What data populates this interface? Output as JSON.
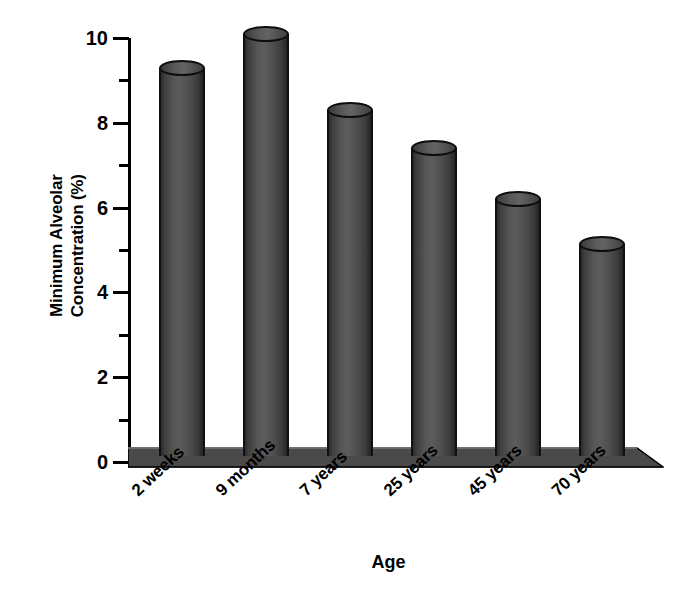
{
  "chart_data": {
    "type": "bar",
    "title": "",
    "subtitle": "",
    "xlabel": "Age",
    "ylabel": "Minimum Alveolar Concentration (%)",
    "ylabel_line1": "Minimum Alveolar",
    "ylabel_line2": "Concentration (%)",
    "categories": [
      "2 weeks",
      "9 months",
      "7 years",
      "25 years",
      "45 years",
      "70 years"
    ],
    "values": [
      9.3,
      10.1,
      8.3,
      7.4,
      6.2,
      5.15
    ],
    "ylim": [
      0,
      10
    ],
    "y_major_ticks": [
      0,
      2,
      4,
      6,
      8,
      10
    ],
    "y_minor_ticks": [
      1,
      3,
      5,
      7,
      9
    ],
    "y_tick_labels": [
      "0",
      "2",
      "4",
      "6",
      "8",
      "10"
    ],
    "grid": false,
    "legend": false,
    "legend_position": "none",
    "series": [
      {
        "name": "Minimum Alveolar Concentration",
        "values": [
          9.3,
          10.1,
          8.3,
          7.4,
          6.2,
          5.15
        ]
      }
    ],
    "style": {
      "bar_style": "3d-cylinder",
      "bar_color": "#4e4e4e",
      "bar_outline_color": "#111111",
      "floor_color": "#4a4a4a",
      "axis_color": "#000000",
      "background": "#ffffff",
      "x_label_rotation": -43
    }
  }
}
